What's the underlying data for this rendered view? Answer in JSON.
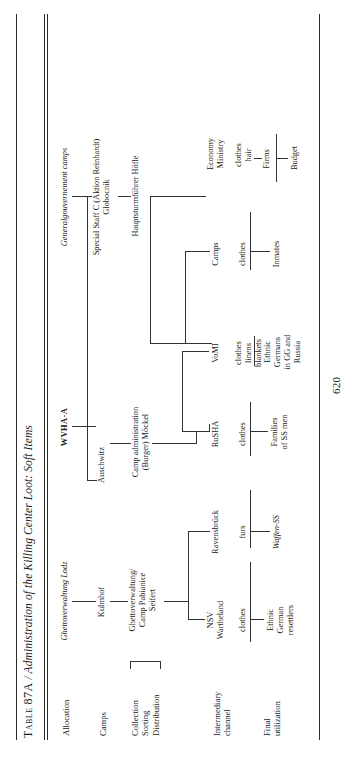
{
  "table": {
    "number": "Table 87A",
    "separator": "/",
    "title": "Administration of the Killing Center Loot: Soft Items",
    "folio": "620"
  },
  "row_labels": [
    {
      "id": "allocation",
      "lines": [
        "Allocation"
      ]
    },
    {
      "id": "camps",
      "lines": [
        "Camps"
      ]
    },
    {
      "id": "collection",
      "lines": [
        "Collection",
        "Sorting",
        "Distribution"
      ]
    },
    {
      "id": "intermediary",
      "lines": [
        "Intermediary",
        "channel"
      ]
    },
    {
      "id": "final",
      "lines": [
        "Final",
        "utilization"
      ]
    }
  ],
  "nodes": {
    "ghettoverwaltung_lodz": "Ghettoverwaltung Lodz",
    "wvha_a": "WVHA-A",
    "generalgouvernement_camps": "Generalgouvernement camps",
    "kulmhof": "Kulmhof",
    "auschwitz": "Auschwitz",
    "special_staff_c_l1": "Special Staff C (",
    "special_staff_c_it": "Aktion Reinhardt",
    "special_staff_c_l1b": ")",
    "special_staff_c_l2": "Globocnik",
    "ghettoverwaltung_pabianice_l1": "Ghettoverwaltung/",
    "ghettoverwaltung_pabianice_l2": "Camp Pabianice",
    "ghettoverwaltung_pabianice_l3": "Seifert",
    "camp_administration_l1": "Camp administration",
    "camp_administration_l2": "(Burger) Möckel",
    "hoefle": "Hauptsturmführer Höfle",
    "nsv_l1": "NSV",
    "nsv_l2": "Wartheland",
    "ravensbrueck": "Ravensbrück",
    "rusha": "RuSHA",
    "vomi": "VoMI",
    "camps_node": "Camps",
    "economy_ministry_l1": "Economy",
    "economy_ministry_l2": "Ministry",
    "goods_nsv": "clothes",
    "goods_ravensbrueck": "furs",
    "goods_rusha": "clothes",
    "goods_vomi_l1": "clothes",
    "goods_vomi_l2": "linens",
    "goods_vomi_l3": "blankets",
    "goods_camps": "clothes",
    "goods_economy_l1": "clothes",
    "goods_economy_l2": "hair",
    "firms": "Firms",
    "waffen_ss": "Waffen-SS",
    "ethnic_german_resettlers_l1": "Ethnic",
    "ethnic_german_resettlers_l2": "German",
    "ethnic_german_resettlers_l3": "resettlers",
    "families_ss_l1": "Families",
    "families_ss_l2": "of SS men",
    "ethnic_germans_gg_l1": "Ethnic",
    "ethnic_germans_gg_l2": "Germans",
    "ethnic_germans_gg_l3": "in GG and",
    "ethnic_germans_gg_l4": "Russia",
    "inmates": "Inmates",
    "budget": "Budget"
  }
}
